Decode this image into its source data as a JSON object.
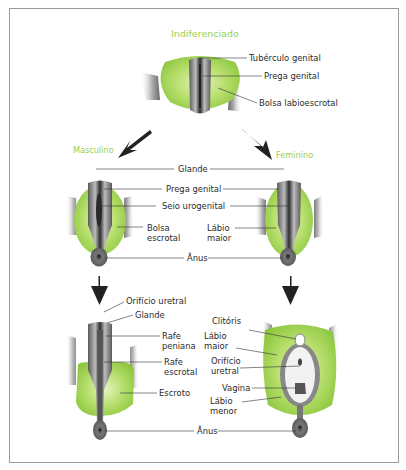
{
  "colors": {
    "green": "#9ccf4a",
    "green_light": "#d8f0a8",
    "gray_dark": "#3a3a3a",
    "gray_mid": "#8a8a8a",
    "line": "#333333",
    "frame": "#9a9a9a"
  },
  "stages": {
    "indifferent": {
      "title": "Indiferenciado",
      "labels": [
        "Tubérculo genital",
        "Prega genital",
        "Bolsa labioescrotal"
      ]
    },
    "male": {
      "title": "Masculino"
    },
    "female": {
      "title": "Feminino"
    },
    "middle_shared": {
      "glande": "Glande",
      "prega_genital": "Prega genital",
      "seio_urogenital": "Seio urogenital",
      "anus": "Ânus"
    },
    "middle_male": {
      "bolsa_1": "Bolsa",
      "bolsa_2": "escrotal"
    },
    "middle_female": {
      "labio_1": "Lábio",
      "labio_2": "maior"
    },
    "bottom_male": {
      "orificio_uretral": "Orifício uretral",
      "glande": "Glande",
      "rafe_peniana_1": "Rafe",
      "rafe_peniana_2": "peniana",
      "rafe_escrotal_1": "Rafe",
      "rafe_escrotal_2": "escrotal",
      "escroto": "Escroto"
    },
    "bottom_female": {
      "clitoris": "Clitóris",
      "labio_maior_1": "Lábio",
      "labio_maior_2": "maior",
      "orificio_1": "Orifício",
      "orificio_2": "uretral",
      "vagina": "Vagina",
      "labio_menor_1": "Lábio",
      "labio_menor_2": "menor"
    },
    "bottom_shared": {
      "anus": "Ânus"
    }
  }
}
